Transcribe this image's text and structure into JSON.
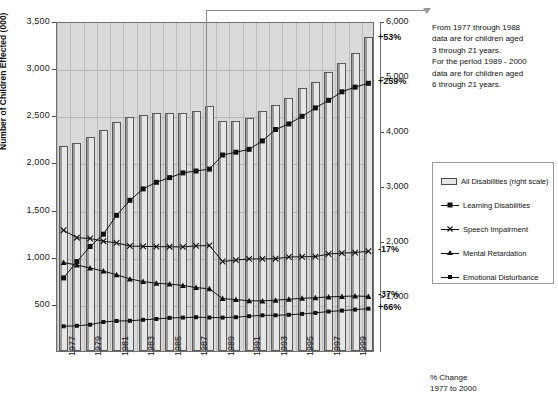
{
  "chart_data": {
    "type": "bar",
    "title": "",
    "xlabel": "",
    "ylabel": "Number of Children Effected (000)",
    "ylim": [
      0,
      3500
    ],
    "y2lim": [
      0,
      6000
    ],
    "grid": true,
    "legend_position": "right",
    "x": [
      1977,
      1978,
      1979,
      1980,
      1981,
      1982,
      1983,
      1984,
      1985,
      1986,
      1987,
      1988,
      1989,
      1990,
      1991,
      1992,
      1993,
      1994,
      1995,
      1996,
      1997,
      1998,
      1999,
      2000
    ],
    "categories": [
      "1977",
      "1978",
      "1979",
      "1980",
      "1981",
      "1982",
      "1983",
      "1984",
      "1985",
      "1986",
      "1987",
      "1988",
      "1989",
      "1990",
      "1991",
      "1992",
      "1993",
      "1994",
      "1995",
      "1996",
      "1997",
      "1998",
      "1999",
      "2000"
    ],
    "xtick_labels": [
      "1977",
      "1979",
      "1981",
      "1983",
      "1985",
      "1987",
      "1989",
      "1991",
      "1993",
      "1995",
      "1997",
      "1999"
    ],
    "ytick_labels_left": [
      "3,500",
      "3,000",
      "2,500",
      "2,000",
      "1,500",
      "1,000",
      "500"
    ],
    "ytick_labels_right": [
      "6,000",
      "5,000",
      "4,000",
      "3,000",
      "2,000",
      "1,000"
    ],
    "series": [
      {
        "name": "All Disabilities (right scale)",
        "type": "bar",
        "axis": "right",
        "marker": "bar-swatch",
        "pct_change": "+53%",
        "values": [
          3730,
          3780,
          3900,
          4010,
          4160,
          4250,
          4300,
          4320,
          4330,
          4330,
          4370,
          4450,
          4180,
          4190,
          4240,
          4370,
          4480,
          4610,
          4780,
          4900,
          5080,
          5230,
          5420,
          5710
        ]
      },
      {
        "name": "Learning Disabilities",
        "type": "line",
        "axis": "left",
        "marker": "square",
        "pct_change": "+259%",
        "values": [
          797,
          970,
          1130,
          1260,
          1460,
          1620,
          1740,
          1810,
          1860,
          1910,
          1930,
          1950,
          2100,
          2130,
          2160,
          2250,
          2370,
          2430,
          2510,
          2600,
          2680,
          2770,
          2820,
          2860
        ]
      },
      {
        "name": "Speech Impairment",
        "type": "line",
        "axis": "left",
        "marker": "x",
        "pct_change": "-17%",
        "values": [
          1302,
          1223,
          1214,
          1186,
          1168,
          1135,
          1131,
          1128,
          1126,
          1125,
          1136,
          1140,
          970,
          985,
          998,
          998,
          1000,
          1018,
          1020,
          1022,
          1050,
          1060,
          1065,
          1080
        ]
      },
      {
        "name": "Mental Retardation",
        "type": "line",
        "axis": "left",
        "marker": "triangle",
        "pct_change": "-37%",
        "values": [
          959,
          933,
          901,
          869,
          829,
          786,
          757,
          740,
          731,
          717,
          694,
          681,
          577,
          566,
          555,
          553,
          560,
          570,
          580,
          585,
          595,
          600,
          605,
          600
        ]
      },
      {
        "name": "Emotional Disturbance",
        "type": "line",
        "axis": "left",
        "marker": "square-small",
        "pct_change": "+66%",
        "values": [
          283,
          288,
          300,
          329,
          339,
          341,
          352,
          361,
          372,
          375,
          380,
          376,
          375,
          380,
          390,
          400,
          400,
          405,
          415,
          425,
          440,
          450,
          460,
          470
        ]
      }
    ],
    "annotations": [
      {
        "name": "data-definition-note",
        "lines": [
          "From 1977 through 1988",
          "data are for children aged",
          "3 through 21 years.",
          "For the period 1989 - 2000",
          "data are for children aged",
          "6 through 21 years."
        ],
        "points_to_year": 1989
      },
      {
        "name": "pct-change-caption",
        "lines": [
          "% Change",
          "1977 to 2000"
        ]
      }
    ]
  },
  "colors": {
    "plot_background": "#d9d9d9",
    "bar_fill": "#e6e6e6",
    "bar_edge": "#5a5a5a",
    "line": "#111111",
    "gridline": "#b4b4b4",
    "page_background": "#ffffff"
  }
}
